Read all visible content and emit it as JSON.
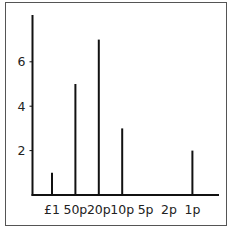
{
  "chart_data": {
    "type": "bar",
    "style": "vertical-line",
    "title": "",
    "xlabel": "",
    "ylabel": "",
    "categories": [
      "£1",
      "50p",
      "20p",
      "10p",
      "5p",
      "2p",
      "1p"
    ],
    "values": [
      1,
      5,
      7,
      3,
      0,
      0,
      2
    ],
    "yticks": [
      "2",
      "4",
      "6"
    ],
    "ylim": [
      0,
      8
    ],
    "grid": false,
    "legend": "none",
    "colors": {
      "line": "#111111",
      "axis": "#111111",
      "frame": "#555555"
    }
  }
}
